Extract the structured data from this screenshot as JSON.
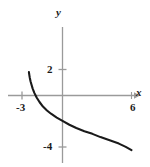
{
  "figure": {
    "name": "coordinate-plane-graph",
    "background_color": "#ffffff",
    "axis_color": "#9a9a9a",
    "curve_color": "#1a1a1a",
    "label_color": "#1a1a1a"
  },
  "axes": {
    "x": {
      "name": "x",
      "label": "x",
      "tick_labels": [
        "-3",
        "6"
      ],
      "ticks": [
        -3,
        6
      ],
      "range": [
        -3.6,
        6.6
      ],
      "arrow": "right"
    },
    "y": {
      "name": "y",
      "label": "y",
      "tick_labels": [
        "2",
        "-4"
      ],
      "ticks": [
        2,
        -4
      ],
      "range": [
        -5.1,
        3.0
      ],
      "arrow": "none"
    }
  },
  "chart_data": {
    "type": "line",
    "title": "",
    "xlabel": "x",
    "ylabel": "y",
    "xlim": [
      -3.6,
      6.6
    ],
    "ylim": [
      -5.1,
      3.0
    ],
    "xticks": [
      -3,
      6
    ],
    "xticklabels": [
      "-3",
      "6"
    ],
    "yticks": [
      2,
      -4
    ],
    "yticklabels": [
      "2",
      "-4"
    ],
    "grid": false,
    "legend": null,
    "series": [
      {
        "name": "curve",
        "color": "#1a1a1a",
        "x": [
          -2.92,
          -2.88,
          -2.84,
          -2.78,
          -2.7,
          -2.6,
          -2.45,
          -2.25,
          -2.0,
          -1.7,
          -1.35,
          -1.0,
          -0.5,
          0.0,
          0.6,
          1.2,
          1.9,
          2.6,
          3.3,
          4.1,
          4.9,
          5.5,
          6.0
        ],
        "y": [
          1.8,
          1.55,
          1.35,
          1.1,
          0.85,
          0.55,
          0.2,
          -0.15,
          -0.5,
          -0.85,
          -1.15,
          -1.4,
          -1.7,
          -1.95,
          -2.25,
          -2.5,
          -2.75,
          -2.95,
          -3.2,
          -3.45,
          -3.7,
          -3.95,
          -4.2
        ]
      }
    ]
  }
}
